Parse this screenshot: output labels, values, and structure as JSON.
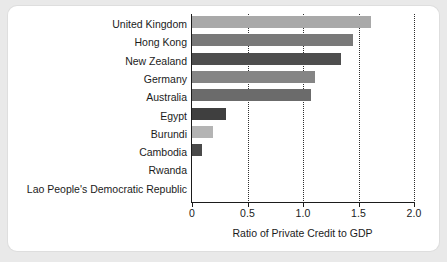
{
  "chart_data": {
    "type": "bar",
    "orientation": "horizontal",
    "title": "",
    "xlabel": "Ratio of Private Credit to GDP",
    "ylabel": "",
    "xlim": [
      0,
      2.0
    ],
    "xticks": [
      "0",
      "0.5",
      "1.0",
      "1.5",
      "2.0"
    ],
    "xtick_values": [
      0,
      0.5,
      1.0,
      1.5,
      2.0
    ],
    "grid": "vertical-dotted",
    "legend": "none",
    "categories": [
      "United Kingdom",
      "Hong Kong",
      "New Zealand",
      "Germany",
      "Australia",
      "Egypt",
      "Burundi",
      "Cambodia",
      "Rwanda",
      "Lao People's Democratic Republic"
    ],
    "values": [
      1.61,
      1.45,
      1.34,
      1.11,
      1.07,
      0.31,
      0.19,
      0.09,
      0.0,
      0.0
    ],
    "bar_colors": [
      "#a9a9a9",
      "#797979",
      "#4e4e4e",
      "#858585",
      "#6b6b6b",
      "#3f3f3f",
      "#b4b4b4",
      "#4a4a4a",
      "#8a8a8a",
      "#8a8a8a"
    ]
  },
  "figure": {
    "background_color": "#e9e9e9",
    "card_color": "#ffffff",
    "axis_color": "#1b1b1b"
  }
}
